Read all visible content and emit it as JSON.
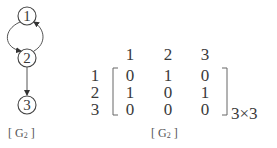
{
  "graph": {
    "nodes": [
      {
        "id": "1",
        "label": "1",
        "x": 27,
        "y": 16
      },
      {
        "id": "2",
        "label": "2",
        "x": 27,
        "y": 58
      },
      {
        "id": "3",
        "label": "3",
        "x": 27,
        "y": 105
      }
    ],
    "edges": [
      {
        "from": "1",
        "to": "2",
        "type": "curved-left"
      },
      {
        "from": "2",
        "to": "1",
        "type": "curved-right"
      },
      {
        "from": "2",
        "to": "3",
        "type": "straight"
      }
    ],
    "caption_bracket_open": "[",
    "caption_letter": "G",
    "caption_sub": "2",
    "caption_bracket_close": "]"
  },
  "matrix": {
    "column_headers": [
      "1",
      "2",
      "3"
    ],
    "row_labels": [
      "1",
      "2",
      "3"
    ],
    "rows": [
      [
        "0",
        "1",
        "0"
      ],
      [
        "1",
        "0",
        "1"
      ],
      [
        "0",
        "0",
        "0"
      ]
    ],
    "dimension": "3×3",
    "caption_bracket_open": "[",
    "caption_letter": "G",
    "caption_sub": "2",
    "caption_bracket_close": "]"
  }
}
